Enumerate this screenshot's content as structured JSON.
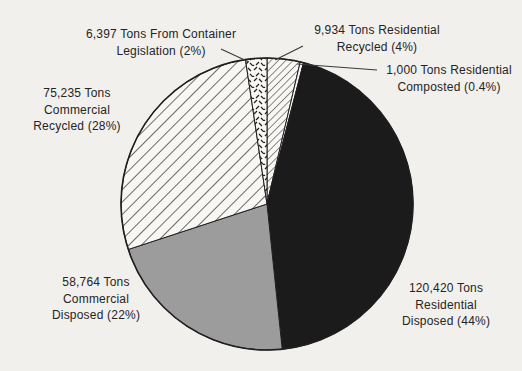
{
  "figure": {
    "title": "",
    "background": "#f2f0ed"
  },
  "chart_data": {
    "type": "pie",
    "unit": "Tons",
    "total_tons": 271750,
    "legend": "none (callout labels around pie)",
    "colors": {
      "slice_black": "#1b1b1b",
      "slice_gray": "#9c9c9c",
      "paper_white": "#f8f7f4",
      "line": "#1f1f1f",
      "leader_line": "#3a3a3a",
      "text": "#242424"
    },
    "start_position": "12 o'clock, clockwise",
    "slices": [
      {
        "id": "residential-recycled",
        "name": "Residential Recycled",
        "tons": 9934,
        "pct": "4%",
        "fill": "hatch-fine",
        "label": "9,934 Tons Residential\nRecycled (4%)"
      },
      {
        "id": "residential-composted",
        "name": "Residential Composted",
        "tons": 1000,
        "pct": "0.4%",
        "fill": "white",
        "label": "1,000 Tons Residential\nComposted (0.4%)"
      },
      {
        "id": "residential-disposed",
        "name": "Residential Disposed",
        "tons": 120420,
        "pct": "44%",
        "fill": "black",
        "label": "120,420 Tons\nResidential\nDisposed (44%)"
      },
      {
        "id": "commercial-disposed",
        "name": "Commercial Disposed",
        "tons": 58764,
        "pct": "22%",
        "fill": "gray",
        "label": "58,764 Tons\nCommercial\nDisposed (22%)"
      },
      {
        "id": "commercial-recycled",
        "name": "Commercial Recycled",
        "tons": 75235,
        "pct": "28%",
        "fill": "hatch",
        "label": "75,235 Tons\nCommercial\nRecycled (28%)"
      },
      {
        "id": "container-legislation",
        "name": "From Container Legislation",
        "tons": 6397,
        "pct": "2%",
        "fill": "dash",
        "label": "6,397 Tons From Container\nLegislation (2%)"
      }
    ]
  }
}
